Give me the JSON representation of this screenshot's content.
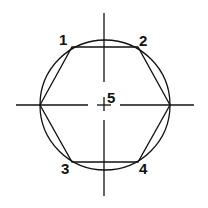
{
  "diagram": {
    "type": "hexagon inscribed in circle with center lines",
    "stroke_color": "#111111",
    "background": "#ffffff",
    "labels": [
      {
        "id": "1",
        "text": "1",
        "x": 59,
        "y": 32
      },
      {
        "id": "2",
        "text": "2",
        "x": 139,
        "y": 33
      },
      {
        "id": "3",
        "text": "3",
        "x": 61,
        "y": 161
      },
      {
        "id": "4",
        "text": "4",
        "x": 139,
        "y": 161
      },
      {
        "id": "5",
        "text": "5",
        "x": 107,
        "y": 90
      }
    ]
  }
}
